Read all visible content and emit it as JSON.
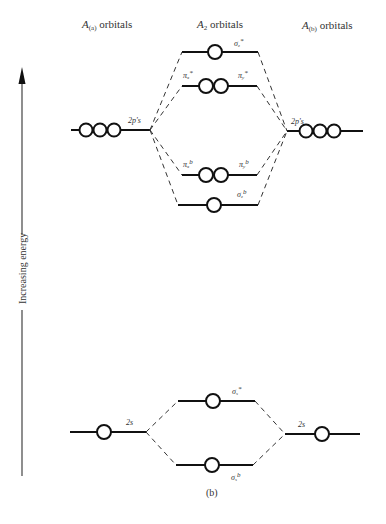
{
  "headers": {
    "left": "A(a) orbitals",
    "left_main": "A",
    "left_sub": "(a)",
    "left_rest": " orbitals",
    "middle_main": "A",
    "middle_sub": "2",
    "middle_rest": " orbitals",
    "right_main": "A",
    "right_sub": "(b)",
    "right_rest": " orbitals"
  },
  "axis": {
    "label": "Increasing energy",
    "direction": "up"
  },
  "atomic_levels": {
    "left_2p": {
      "label": "2p's",
      "orbitals": 3
    },
    "right_2p": {
      "label": "2p's",
      "orbitals": 3
    },
    "left_2s": {
      "label": "2s",
      "orbitals": 1
    },
    "right_2s": {
      "label": "2s",
      "orbitals": 1
    }
  },
  "molecular_levels": {
    "sigma_z_star": {
      "symbol": "σ",
      "sub": "z",
      "sup": "*",
      "orbitals": 1
    },
    "pi_star": {
      "left_symbol": "π",
      "left_sub": "x",
      "left_sup": "*",
      "right_symbol": "π",
      "right_sub": "y",
      "right_sup": "*",
      "orbitals": 2
    },
    "pi_bonding": {
      "left_symbol": "π",
      "left_sub": "x",
      "left_sup": "b",
      "right_symbol": "π",
      "right_sub": "y",
      "right_sup": "b",
      "orbitals": 2
    },
    "sigma_z_bonding": {
      "symbol": "σ",
      "sub": "z",
      "sup": "b",
      "orbitals": 1
    },
    "sigma_s_star": {
      "symbol": "σ",
      "sub": "s",
      "sup": "*",
      "orbitals": 1
    },
    "sigma_s_bonding": {
      "symbol": "σ",
      "sub": "s",
      "sup": "b",
      "orbitals": 1
    }
  },
  "caption": "(b)"
}
